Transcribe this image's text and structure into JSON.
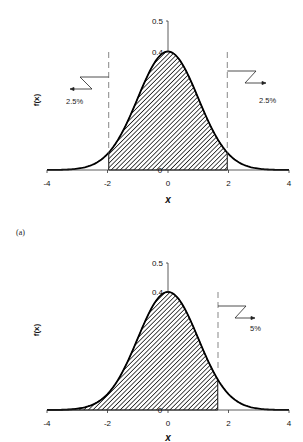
{
  "chart_data": [
    {
      "type": "area",
      "title": "",
      "description": "Standard normal density f(x) with two-tailed 95% central region shaded",
      "xlabel": "x",
      "ylabel": "f(x)",
      "xlim": [
        -4,
        4
      ],
      "ylim": [
        0,
        0.5
      ],
      "x_ticks": [
        "-4",
        "-2",
        "0",
        "2",
        "4"
      ],
      "y_ticks": [
        "0",
        "0.4",
        "0.5"
      ],
      "grid": false,
      "shaded_region": [
        -1.96,
        1.96
      ],
      "cutoffs": [
        -1.96,
        1.96
      ],
      "annotations": [
        {
          "text": "2.5%",
          "side": "left"
        },
        {
          "text": "2.5%",
          "side": "right"
        }
      ],
      "series": [
        {
          "name": "f(x)",
          "function": "normal_pdf",
          "mean": 0,
          "sd": 1
        }
      ]
    },
    {
      "type": "area",
      "title": "",
      "description": "Standard normal density f(x) with one-tailed 95% region shaded",
      "xlabel": "x",
      "ylabel": "f(x)",
      "xlim": [
        -4,
        4
      ],
      "ylim": [
        0,
        0.5
      ],
      "x_ticks": [
        "-4",
        "-2",
        "0",
        "2",
        "4"
      ],
      "y_ticks": [
        "0",
        "0.4",
        "0.5"
      ],
      "grid": false,
      "shaded_region": [
        -4,
        1.645
      ],
      "cutoffs": [
        1.645
      ],
      "annotations": [
        {
          "text": "5%",
          "side": "right"
        }
      ],
      "series": [
        {
          "name": "f(x)",
          "function": "normal_pdf",
          "mean": 0,
          "sd": 1
        }
      ]
    }
  ],
  "labels": {
    "panel_a": "(a)",
    "top": {
      "y_tick_05": "0.5",
      "y_tick_04": "0.4",
      "y_tick_0": "0",
      "x_ticks": [
        "-4",
        "-2",
        "0",
        "2",
        "4"
      ],
      "xlabel": "x",
      "ylabel": "f(x)",
      "left_pct": "2.5%",
      "right_pct": "2.5%"
    },
    "bottom": {
      "y_tick_05": "0.5",
      "y_tick_04": "0.4",
      "y_tick_0": "0",
      "x_ticks": [
        "-4",
        "-2",
        "0",
        "2",
        "4"
      ],
      "xlabel": "x",
      "ylabel": "f(x)",
      "right_pct": "5%"
    }
  }
}
